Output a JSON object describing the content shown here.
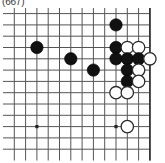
{
  "caption": {
    "text": "(667)"
  },
  "board": {
    "type": "go-board-diagram",
    "cols": 13,
    "rows": 13,
    "origin_x": 14.3,
    "origin_y": 5.6,
    "spacing": 11.3,
    "line_color": "#555555",
    "edge_color": "#333333",
    "line_width": 1,
    "edge_width": 1.7,
    "black_color": "#111111",
    "white_color": "#ffffff",
    "stone_outline": "#2b2b2b",
    "stone_diameter": 12.4,
    "star_points": [
      {
        "col": 2,
        "row": 3
      },
      {
        "col": 2,
        "row": 10
      },
      {
        "col": 9,
        "row": 10
      }
    ],
    "edges": {
      "top": false,
      "right": true,
      "bottom": false,
      "left": false
    },
    "stones": [
      {
        "col": 9,
        "row": 1,
        "color": "black"
      },
      {
        "col": 2,
        "row": 3,
        "color": "black"
      },
      {
        "col": 9,
        "row": 3,
        "color": "black"
      },
      {
        "col": 10,
        "row": 3,
        "color": "white"
      },
      {
        "col": 11,
        "row": 3,
        "color": "white"
      },
      {
        "col": 5,
        "row": 4,
        "color": "black"
      },
      {
        "col": 9,
        "row": 4,
        "color": "black"
      },
      {
        "col": 10,
        "row": 4,
        "color": "black"
      },
      {
        "col": 11,
        "row": 4,
        "color": "black"
      },
      {
        "col": 12,
        "row": 4,
        "color": "white"
      },
      {
        "col": 7,
        "row": 5,
        "color": "black"
      },
      {
        "col": 10,
        "row": 5,
        "color": "black"
      },
      {
        "col": 11,
        "row": 5,
        "color": "white"
      },
      {
        "col": 10,
        "row": 6,
        "color": "black"
      },
      {
        "col": 11,
        "row": 6,
        "color": "white"
      },
      {
        "col": 9,
        "row": 7,
        "color": "white"
      },
      {
        "col": 10,
        "row": 7,
        "color": "white"
      },
      {
        "col": 10,
        "row": 10,
        "color": "white"
      }
    ]
  }
}
